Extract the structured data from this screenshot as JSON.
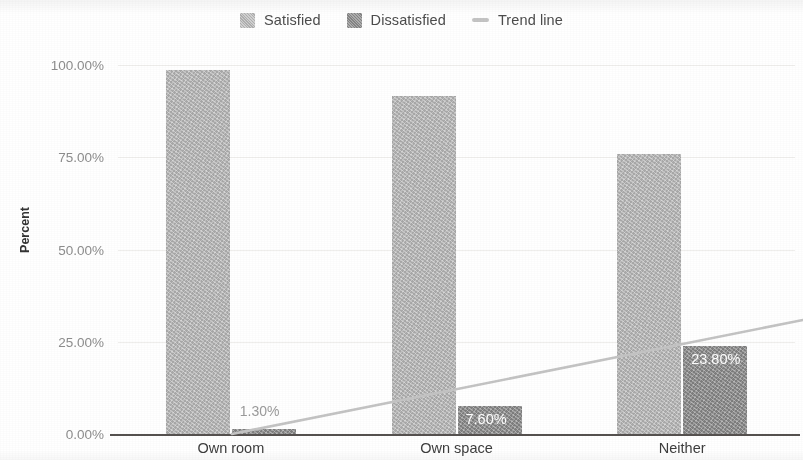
{
  "chart_data": {
    "type": "bar",
    "title": "",
    "xlabel": "",
    "ylabel": "Percent",
    "categories": [
      "Own room",
      "Own space",
      "Neither"
    ],
    "series": [
      {
        "name": "Satisfied",
        "color": "#b6b6b6",
        "values": [
          98.7,
          91.5,
          75.8
        ],
        "labels": [
          "",
          "",
          ""
        ]
      },
      {
        "name": "Dissatisfied",
        "color": "#8c8c8c",
        "values": [
          1.3,
          7.6,
          23.8
        ],
        "labels": [
          "1.30%",
          "7.60%",
          "23.80%"
        ]
      }
    ],
    "trend_line": {
      "name": "Trend line",
      "color": "#c4c4c4",
      "values": [
        1.3,
        7.6,
        23.8
      ],
      "x_start_pct": 0.0,
      "y_start": 0.0,
      "y_end": 30.9
    },
    "yticks": [
      "0.00%",
      "25.00%",
      "50.00%",
      "75.00%",
      "100.00%"
    ],
    "ytick_values": [
      0,
      25,
      50,
      75,
      100
    ],
    "ylim": [
      0,
      100
    ],
    "grid": true,
    "legend_position": "top-center"
  },
  "legend": {
    "items": [
      {
        "label": "Satisfied",
        "swatch": "satisfied-swatch-icon",
        "color": "#b6b6b6"
      },
      {
        "label": "Dissatisfied",
        "swatch": "dissatisfied-swatch-icon",
        "color": "#8c8c8c"
      },
      {
        "label": "Trend line",
        "swatch": "trend-line-swatch-icon",
        "color": "#c4c4c4"
      }
    ]
  },
  "axis": {
    "y_title": "Percent"
  }
}
